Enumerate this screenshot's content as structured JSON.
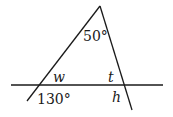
{
  "diagram": {
    "stroke_color": "#1a1a1a",
    "background": "#ffffff",
    "lines": {
      "horizontal": {
        "x1": 11,
        "y1": 85,
        "x2": 163,
        "y2": 85
      },
      "left_side": {
        "x1": 27,
        "y1": 101,
        "x2": 100,
        "y2": 6
      },
      "right_side": {
        "x1": 100,
        "y1": 6,
        "x2": 132,
        "y2": 110
      }
    },
    "labels": {
      "apex_angle": "50°",
      "left_interior": "w",
      "left_exterior": "130°",
      "right_interior": "t",
      "right_exterior": "h"
    }
  }
}
